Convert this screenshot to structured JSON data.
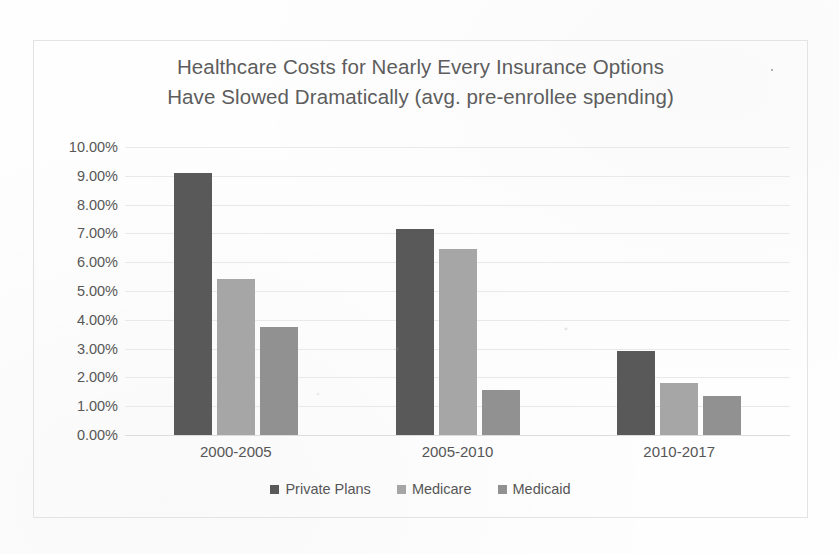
{
  "chart_data": {
    "type": "bar",
    "title": "Healthcare Costs for Nearly Every Insurance Options Have Slowed Dramatically (avg. pre-enrollee spending)",
    "title_lines": [
      "Healthcare Costs for Nearly Every Insurance Options",
      "Have Slowed Dramatically (avg. pre-enrollee spending)"
    ],
    "xlabel": "",
    "ylabel": "",
    "categories": [
      "2000-2005",
      "2005-2010",
      "2010-2017"
    ],
    "series": [
      {
        "name": "Private Plans",
        "color": "#595959",
        "values": [
          9.1,
          7.15,
          2.92
        ]
      },
      {
        "name": "Medicare",
        "color": "#a6a6a6",
        "values": [
          5.4,
          6.45,
          1.82
        ]
      },
      {
        "name": "Medicaid",
        "color": "#919191",
        "values": [
          3.75,
          1.55,
          1.35
        ]
      }
    ],
    "ylim": [
      0,
      10
    ],
    "ytick_values": [
      10,
      9,
      8,
      7,
      6,
      5,
      4,
      3,
      2,
      1,
      0
    ],
    "ytick_labels": [
      "10.00%",
      "9.00%",
      "8.00%",
      "7.00%",
      "6.00%",
      "5.00%",
      "4.00%",
      "3.00%",
      "2.00%",
      "1.00%",
      "0.00%"
    ],
    "value_unit": "%",
    "grid": true,
    "legend_position": "bottom"
  },
  "axes": {
    "y": {
      "ticks": [
        {
          "label": "10.00%",
          "value": 10
        },
        {
          "label": "9.00%",
          "value": 9
        },
        {
          "label": "8.00%",
          "value": 8
        },
        {
          "label": "7.00%",
          "value": 7
        },
        {
          "label": "6.00%",
          "value": 6
        },
        {
          "label": "5.00%",
          "value": 5
        },
        {
          "label": "4.00%",
          "value": 4
        },
        {
          "label": "3.00%",
          "value": 3
        },
        {
          "label": "2.00%",
          "value": 2
        },
        {
          "label": "1.00%",
          "value": 1
        },
        {
          "label": "0.00%",
          "value": 0
        }
      ]
    },
    "x": {
      "ticks": [
        {
          "label": "2000-2005"
        },
        {
          "label": "2005-2010"
        },
        {
          "label": "2010-2017"
        }
      ]
    }
  },
  "legend": {
    "items": [
      {
        "label": "Private Plans",
        "color": "#595959"
      },
      {
        "label": "Medicare",
        "color": "#a6a6a6"
      },
      {
        "label": "Medicaid",
        "color": "#919191"
      }
    ]
  },
  "colors": {
    "private_plans": "#595959",
    "medicare": "#a6a6a6",
    "medicaid": "#919191",
    "title_text": "#5d5d5d",
    "axis_text": "#565656",
    "gridline": "#e9e9e9",
    "frame": "#e3e3e3",
    "background": "#fefefe"
  }
}
